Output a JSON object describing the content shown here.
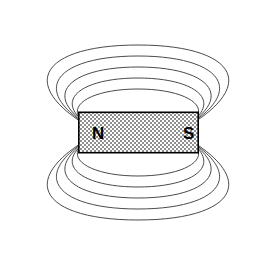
{
  "figure": {
    "background_color": "#ffffff",
    "width": 277,
    "height": 262
  },
  "magnet": {
    "north_label": "N",
    "south_label": "S",
    "fill_pattern": "checkerboard-hatch",
    "fill_color": "#9a9a9a",
    "border_color": "#000000",
    "x": 78,
    "y": 112,
    "width": 120,
    "height": 41
  },
  "field": {
    "line_color": "#4a4a4a",
    "line_width": 1,
    "loop_count_top": 5,
    "loop_count_bottom": 5,
    "description": "Concentric elliptical magnetic flux loops emerging from the N pole and returning to the S pole"
  },
  "chart_data": {
    "type": "line",
    "xlabel": "",
    "ylabel": "",
    "xlim": [
      0,
      277
    ],
    "ylim": [
      0,
      262
    ],
    "grid": false,
    "legend": "none",
    "annotations": [
      "N",
      "S"
    ],
    "series": [
      {
        "name": "top-loop-1",
        "rx": 52,
        "ry": 23,
        "cx": 138,
        "cy": 112
      },
      {
        "name": "top-loop-2",
        "rx": 72,
        "ry": 34,
        "cx": 138,
        "cy": 115
      },
      {
        "name": "top-loop-3",
        "rx": 91,
        "ry": 45,
        "cx": 138,
        "cy": 118
      },
      {
        "name": "top-loop-4",
        "rx": 108,
        "ry": 56,
        "cx": 138,
        "cy": 121
      },
      {
        "name": "top-loop-5",
        "rx": 123,
        "ry": 67,
        "cx": 138,
        "cy": 124
      },
      {
        "name": "bottom-loop-1",
        "rx": 52,
        "ry": 23,
        "cx": 138,
        "cy": 153
      },
      {
        "name": "bottom-loop-2",
        "rx": 72,
        "ry": 34,
        "cx": 138,
        "cy": 150
      },
      {
        "name": "bottom-loop-3",
        "rx": 91,
        "ry": 45,
        "cx": 138,
        "cy": 147
      },
      {
        "name": "bottom-loop-4",
        "rx": 108,
        "ry": 56,
        "cx": 138,
        "cy": 144
      },
      {
        "name": "bottom-loop-5",
        "rx": 123,
        "ry": 67,
        "cx": 138,
        "cy": 141
      }
    ]
  }
}
